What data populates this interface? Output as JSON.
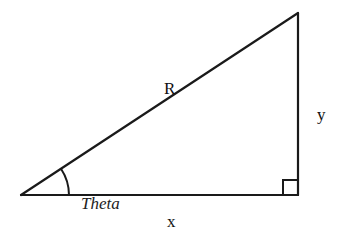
{
  "diagram": {
    "type": "right-triangle",
    "stroke_color": "#1a1a1a",
    "background": "#ffffff",
    "vertices": {
      "origin": [
        21,
        195
      ],
      "right_angle": [
        298,
        195
      ],
      "apex": [
        298,
        13
      ]
    },
    "labels": {
      "hypotenuse": "R",
      "opposite": "y",
      "adjacent": "x",
      "angle": "Theta"
    },
    "right_angle_marker": true,
    "angle_arc": true
  }
}
